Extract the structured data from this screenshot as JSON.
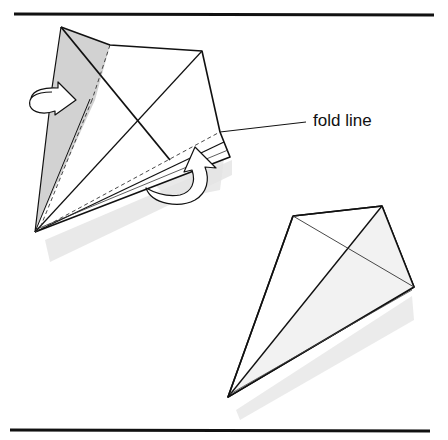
{
  "diagram": {
    "type": "origami-instruction",
    "annotations": [
      {
        "id": "fold-line",
        "text": "fold line"
      }
    ],
    "figures": [
      {
        "id": "step-fold",
        "description": "kite base with two flaps being folded inward along fold lines; two curved arrows indicate the folds"
      },
      {
        "id": "step-result",
        "description": "resulting narrow kite shape after folding"
      }
    ],
    "colors": {
      "line": "#111111",
      "shade": "#cfcfcf",
      "shadow": "#e4e4e4",
      "paper": "#ffffff"
    }
  }
}
